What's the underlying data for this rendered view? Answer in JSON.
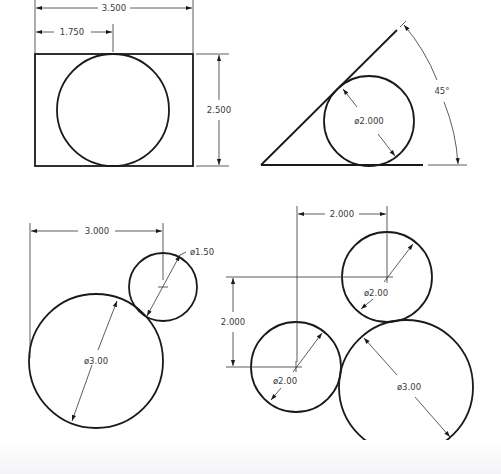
{
  "figure": {
    "panels": [
      {
        "id": "rectangle-with-circle",
        "dimensions": {
          "overall_width": "3.500",
          "center_offset": "1.750",
          "height": "2.500"
        }
      },
      {
        "id": "triangle-with-inscribed-circle",
        "dimensions": {
          "angle": "45°",
          "circle_diameter": "ø2.000"
        }
      },
      {
        "id": "tangent-circles-pair",
        "dimensions": {
          "horizontal_distance": "3.000",
          "small_diameter": "ø1.50",
          "large_diameter": "ø3.00"
        }
      },
      {
        "id": "three-tangent-circles",
        "dimensions": {
          "horizontal_distance": "2.000",
          "vertical_distance": "2.000",
          "upper_circle_diameter": "ø2.00",
          "left_circle_diameter": "ø2.00",
          "large_circle_diameter": "ø3.00"
        }
      }
    ]
  },
  "colors": {
    "line": "#1a1a1a",
    "dimension_line": "#333333",
    "text": "#3a3a3a",
    "background": "#ffffff"
  }
}
